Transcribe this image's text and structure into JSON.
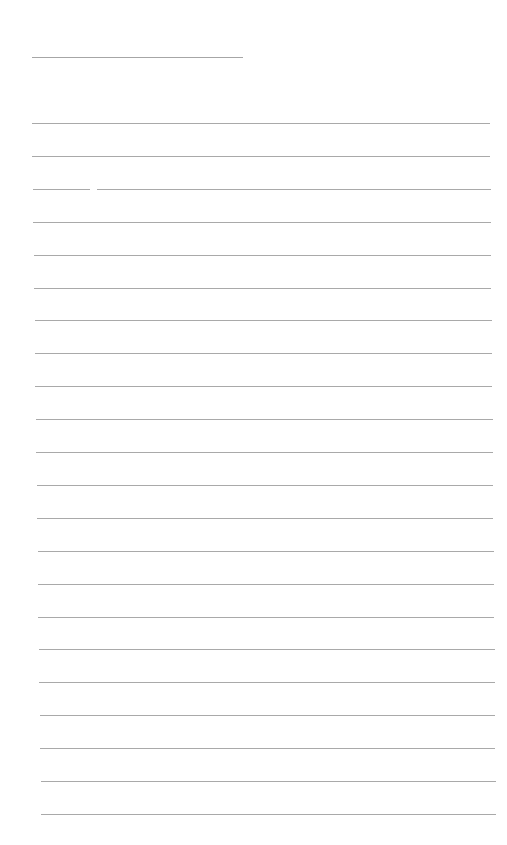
{
  "document": {
    "type": "lined-paper",
    "background_color": "#ffffff",
    "line_color": "#a9a9a9",
    "header_line": {
      "x1": 32,
      "x2": 243,
      "y": 57
    },
    "writing_lines": {
      "count": 22,
      "first_y": 123,
      "spacing": 33,
      "left_start": 32,
      "left_end": 41,
      "right_start": 490,
      "right_end": 496
    },
    "line_breaks": [
      {
        "line_index": 2,
        "x1": 90,
        "x2": 97
      }
    ]
  }
}
